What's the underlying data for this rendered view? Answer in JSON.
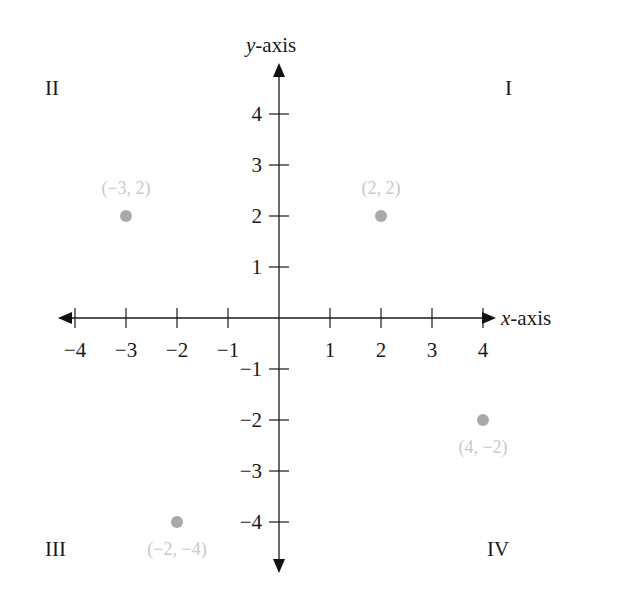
{
  "chart_data": {
    "type": "scatter",
    "title": "",
    "xlabel": "x-axis",
    "ylabel": "y-axis",
    "xlim": [
      -4.5,
      4.5
    ],
    "ylim": [
      -4.5,
      4.5
    ],
    "grid": false,
    "x_ticks": [
      -4,
      -3,
      -2,
      -1,
      1,
      2,
      3,
      4
    ],
    "y_ticks": [
      -4,
      -3,
      -2,
      -1,
      1,
      2,
      3,
      4
    ],
    "x_tick_labels": [
      "-4",
      "-3",
      "-2",
      "-1",
      "1",
      "2",
      "3",
      "4"
    ],
    "y_tick_labels": [
      "-4",
      "-3",
      "-2",
      "-1",
      "1",
      "2",
      "3",
      "4"
    ],
    "quadrants": [
      {
        "label": "I"
      },
      {
        "label": "II"
      },
      {
        "label": "III"
      },
      {
        "label": "IV"
      }
    ],
    "points": [
      {
        "x": -3,
        "y": 2,
        "label": "(-3, 2)"
      },
      {
        "x": 2,
        "y": 2,
        "label": "(2, 2)"
      },
      {
        "x": 4,
        "y": -2,
        "label": "(4, -2)"
      },
      {
        "x": -2,
        "y": -4,
        "label": "(-2, -4)"
      }
    ],
    "legend": null
  },
  "axes": {
    "x_title_prefix": "x",
    "x_title_suffix": "-axis",
    "y_title_prefix": "y",
    "y_title_suffix": "-axis"
  },
  "colors": {
    "axis": "#1a1a1a",
    "point": "#a9a9a9",
    "point_label": "#c9c9c9"
  }
}
